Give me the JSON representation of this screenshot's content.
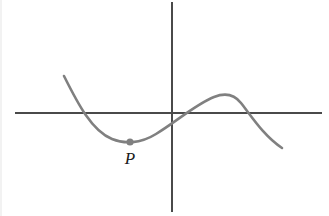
{
  "figure": {
    "width": 329,
    "height": 216,
    "background_color": "#ffffff"
  },
  "colors": {
    "axis": "#4a4a4a",
    "curve": "#808080",
    "point": "#808080",
    "label_text": "#1a1a1a"
  },
  "axes": {
    "x_axis": {
      "name": "x-axis",
      "y": 113,
      "x_start": 15,
      "x_end": 322,
      "stroke_width": 1.2
    },
    "y_axis": {
      "name": "y-axis",
      "x": 172,
      "y_start": 2,
      "y_end": 212,
      "stroke_width": 1.2
    },
    "origin": {
      "x": 172,
      "y": 113
    }
  },
  "curve": {
    "name": "cubic-curve",
    "stroke_width": 2.6,
    "path": "M 64 76 C 78 104, 92 131, 112 139 C 124 144, 140 144, 156 134 C 176 122, 196 104, 214 97 C 224 93, 234 94, 241 103 C 252 117, 264 136, 282 148",
    "start_point": {
      "x": 64,
      "y": 76
    },
    "end_point": {
      "x": 282,
      "y": 148
    },
    "local_minimum": {
      "x": 130,
      "y": 142
    },
    "local_maximum": {
      "x": 232,
      "y": 96
    },
    "x_axis_crossings": [
      {
        "x": 82,
        "y": 113
      },
      {
        "x": 197,
        "y": 113
      },
      {
        "x": 262,
        "y": 113
      }
    ]
  },
  "marked_point": {
    "name": "point-P",
    "label": "P",
    "x": 130,
    "y": 142,
    "radius": 3.6,
    "label_x": 130,
    "label_y": 164,
    "label_font_size": 17
  }
}
